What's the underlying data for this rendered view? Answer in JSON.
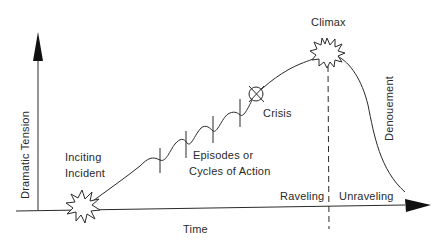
{
  "diagram": {
    "type": "dramatic-structure-curve",
    "axes": {
      "x_label": "Time",
      "y_label": "Dramatic Tension"
    },
    "labels": {
      "inciting_line1": "Inciting",
      "inciting_line2": "Incident",
      "episodes_line1": "Episodes or",
      "episodes_line2": "Cycles of Action",
      "crisis": "Crisis",
      "climax": "Climax",
      "denouement": "Denouement",
      "raveling": "Raveling",
      "unraveling": "Unraveling"
    },
    "stroke_color": "#2a2a2a",
    "background": "#ffffff"
  }
}
